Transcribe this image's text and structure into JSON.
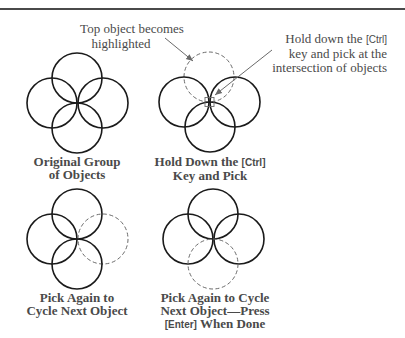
{
  "callouts": {
    "top_object": {
      "lines": [
        "Top object becomes",
        "highlighted"
      ]
    },
    "hold_ctrl": {
      "line1_prefix": "Hold down the ",
      "line1_key": "[Ctrl]",
      "line2": "key and pick at the",
      "line3": "intersection of objects"
    }
  },
  "panels": [
    {
      "caption_lines": [
        "Original Group",
        "of Objects"
      ],
      "highlighted": "none"
    },
    {
      "caption_line1_prefix": "Hold Down the ",
      "caption_key": "[Ctrl]",
      "caption_line2": "Key and Pick",
      "highlighted": "top"
    },
    {
      "caption_lines": [
        "Pick Again to",
        "Cycle Next Object"
      ],
      "highlighted": "right"
    },
    {
      "caption_line1": "Pick Again to Cycle",
      "caption_line2": "Next Object—Press",
      "caption_key": "[Enter]",
      "caption_line3_suffix": " When Done",
      "highlighted": "bottom"
    }
  ],
  "colors": {
    "solid": "#1a1a1a",
    "dashed": "#6a6a6a",
    "text": "#4a4a4a",
    "rule": "#4a4a4a"
  }
}
